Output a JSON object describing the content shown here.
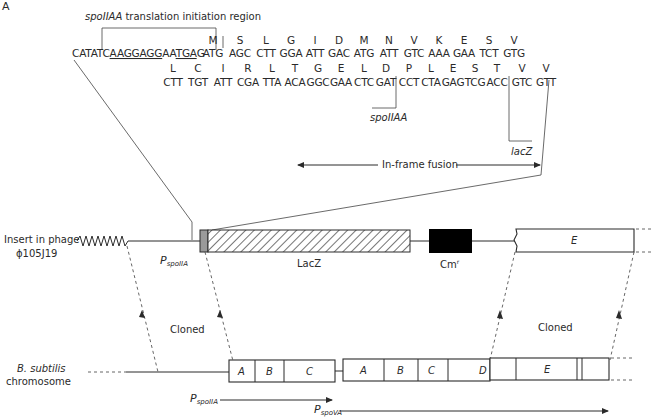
{
  "panel_label": "A",
  "initiation_region": {
    "label_italic": "spoIIAA",
    "label_rest": " translation initiation region"
  },
  "sequence_row1": {
    "leader": "CATATCAAGGAGGAATGAG",
    "underlined": [
      "AAGGAGG",
      "TGA"
    ],
    "codons": [
      "ATG",
      "AGC",
      "CTT",
      "GGA",
      "ATT",
      "GAC",
      "ATG",
      "ATT",
      "GTC",
      "AAA",
      "GAA",
      "TCT",
      "GTG"
    ],
    "amino_acids": [
      "M",
      "S",
      "L",
      "G",
      "I",
      "D",
      "M",
      "N",
      "V",
      "K",
      "E",
      "S",
      "V"
    ]
  },
  "sequence_row2": {
    "codons": [
      "CTT",
      "TGT",
      "ATT",
      "CGA",
      "TTA",
      "ACA",
      "GGC",
      "GAA",
      "CTC",
      "GAT",
      "CCT",
      "CTA",
      "GAG",
      "TCG",
      "ACC",
      "GTC",
      "GTT"
    ],
    "amino_acids": [
      "L",
      "C",
      "I",
      "R",
      "L",
      "T",
      "G",
      "E",
      "L",
      "D",
      "P",
      "L",
      "E",
      "S",
      "T",
      "V",
      "V"
    ]
  },
  "junction_labels": {
    "spoIIAA": "spoIIAA",
    "lacZ": "lacZ"
  },
  "in_frame_fusion": "In-frame fusion",
  "phage_insert": {
    "label_line1": "Insert in phage",
    "label_line2": "ϕ105J19",
    "promoter": "P",
    "promoter_sub": "spoIIA",
    "lacz": "LacZ",
    "cm": "Cm",
    "cm_sup": "r",
    "gene_e": "E"
  },
  "cloned_labels": [
    "Cloned",
    "Cloned"
  ],
  "chromosome": {
    "label_line1": "B. subtilis",
    "label_line2": "chromosome",
    "operon1_genes": [
      "A",
      "B",
      "C"
    ],
    "operon2_genes": [
      "A",
      "B",
      "C",
      "D",
      "E"
    ],
    "promoter1": "P",
    "promoter1_sub": "spoIIA",
    "promoter2": "P",
    "promoter2_sub": "spoVA"
  },
  "colors": {
    "ink": "#2a2a2a",
    "cm_box": "#000000",
    "spoIIAA_stub": "#9a9a9a"
  }
}
